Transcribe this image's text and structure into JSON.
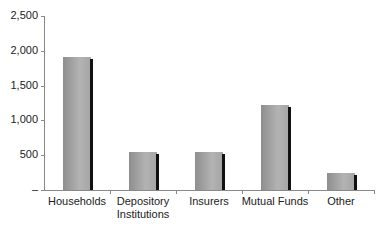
{
  "chart_data": {
    "type": "bar",
    "title": "",
    "xlabel": "",
    "ylabel": "",
    "categories": [
      "Households",
      "Depository Institutions",
      "Insurers",
      "Mutual Funds",
      "Other"
    ],
    "values": [
      1910,
      540,
      550,
      1220,
      240
    ],
    "ylim": [
      0,
      2500
    ],
    "yticks": [
      0,
      500,
      1000,
      1500,
      2000,
      2500
    ],
    "ytick_labels": [
      "–",
      "500",
      "1,000",
      "1,500",
      "2,000",
      "2,500"
    ],
    "grid": false,
    "legend": null
  },
  "labels": {
    "categories": [
      "Households",
      "Depository\nInstitutions",
      "Insurers",
      "Mutual Funds",
      "Other"
    ]
  }
}
